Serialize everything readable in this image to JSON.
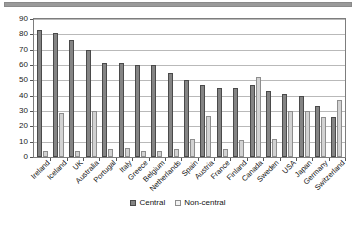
{
  "chart_data": {
    "type": "bar",
    "title": "",
    "xlabel": "",
    "ylabel": "",
    "ylim": [
      0,
      90
    ],
    "ytick_step": 10,
    "yticks": [
      0,
      10,
      20,
      30,
      40,
      50,
      60,
      70,
      80,
      90
    ],
    "grid": true,
    "legend_position": "bottom",
    "categories": [
      "Ireland",
      "Iceland",
      "UK",
      "Australia",
      "Portugal",
      "Italy",
      "Greece",
      "Belgium",
      "Netherlands",
      "Spain",
      "Austria",
      "France",
      "Finland",
      "Canada",
      "Sweden",
      "USA",
      "Japan",
      "Germany",
      "Switzerland"
    ],
    "series": [
      {
        "name": "Central",
        "color": "#848484",
        "values": [
          83,
          81,
          76,
          70,
          61,
          61,
          60,
          60,
          55,
          50,
          47,
          45,
          45,
          47,
          43,
          41,
          40,
          33,
          26
        ]
      },
      {
        "name": "Non-central",
        "color": "#d2d2d2",
        "values": [
          4,
          29,
          4,
          30,
          5,
          6,
          4,
          4,
          5,
          12,
          27,
          5,
          11,
          52,
          12,
          30,
          30,
          26,
          37
        ]
      }
    ]
  },
  "legend": {
    "items": [
      {
        "label": "Central"
      },
      {
        "label": "Non-central"
      }
    ]
  }
}
